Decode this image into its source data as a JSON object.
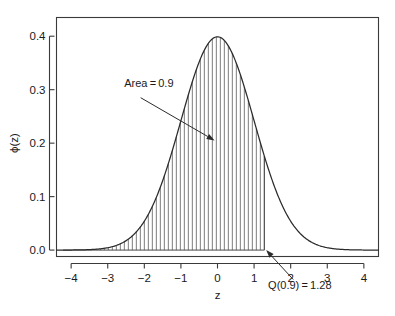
{
  "chart_data": {
    "type": "line",
    "title": "",
    "subtitle": "",
    "xlabel": "z",
    "ylabel": "ϕ(z)",
    "xlim": [
      -4.4,
      4.4
    ],
    "ylim": [
      -0.012,
      0.435
    ],
    "grid": false,
    "legend": null,
    "curve": {
      "name": "standard normal density",
      "formula": "phi(z) = exp(-z^2/2)/sqrt(2*pi)",
      "peak_x": 0,
      "peak_y": 0.3989,
      "x": [
        -4,
        -3.75,
        -3.5,
        -3.25,
        -3,
        -2.75,
        -2.5,
        -2.25,
        -2,
        -1.75,
        -1.5,
        -1.25,
        -1,
        -0.75,
        -0.5,
        -0.25,
        0,
        0.25,
        0.5,
        0.75,
        1,
        1.25,
        1.5,
        1.75,
        2,
        2.25,
        2.5,
        2.75,
        3,
        3.25,
        3.5,
        3.75,
        4
      ],
      "y": [
        0.0001,
        0.0004,
        0.0009,
        0.002,
        0.0044,
        0.0091,
        0.0175,
        0.0317,
        0.054,
        0.0863,
        0.1295,
        0.1826,
        0.242,
        0.3011,
        0.3521,
        0.3867,
        0.3989,
        0.3867,
        0.3521,
        0.3011,
        0.242,
        0.1826,
        0.1295,
        0.0863,
        0.054,
        0.0317,
        0.0175,
        0.0091,
        0.0044,
        0.002,
        0.0009,
        0.0004,
        0.0001
      ]
    },
    "shaded_region": {
      "label": "Area = 0.9",
      "area": 0.9,
      "x_from": -4,
      "x_to": 1.28,
      "fill_style": "vertical hatch lines"
    },
    "xticks": [
      -4,
      -3,
      -2,
      -1,
      0,
      1,
      2,
      3,
      4
    ],
    "xtick_labels": [
      "−4",
      "−3",
      "−2",
      "−1",
      "0",
      "1",
      "2",
      "3",
      "4"
    ],
    "yticks": [
      0.0,
      0.1,
      0.2,
      0.3,
      0.4
    ],
    "ytick_labels": [
      "0.0",
      "0.1",
      "0.2",
      "0.3",
      "0.4"
    ],
    "annotations": [
      {
        "id": "area-annotation",
        "text": "Area = 0.9",
        "text_x": -2.55,
        "text_y": 0.305,
        "arrow_from": [
          -2.1,
          0.285
        ],
        "arrow_to": [
          -0.08,
          0.205
        ]
      },
      {
        "id": "quantile-annotation",
        "text": "Q(0.9) = 1.28",
        "text_x": 2.25,
        "text_y": -0.072,
        "arrow_from": [
          2.07,
          -0.055
        ],
        "arrow_to": [
          1.33,
          0.0
        ],
        "quantile_p": 0.9,
        "quantile_value": 1.28
      }
    ],
    "colors": {
      "curve": "#2b2b2b",
      "frame": "#3a3a3a",
      "hatch": "#6e6e6e",
      "text": "#1a1a1a",
      "background": "#ffffff"
    }
  }
}
